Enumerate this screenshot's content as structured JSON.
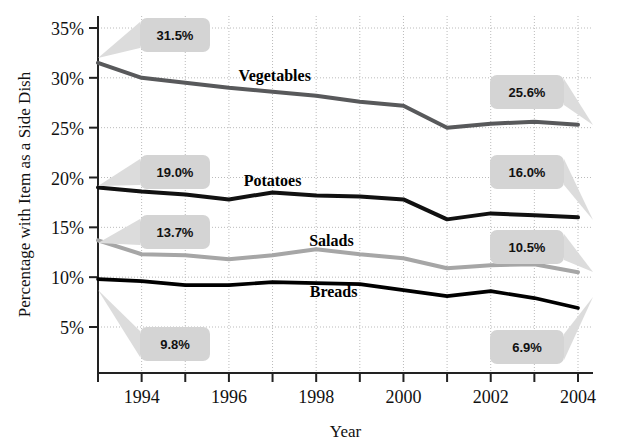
{
  "chart_data": {
    "type": "line",
    "title": "",
    "xlabel": "Year",
    "ylabel": "Percentage with Item as a Side Dish",
    "x": [
      1993,
      1994,
      1995,
      1996,
      1997,
      1998,
      1999,
      2000,
      2001,
      2002,
      2003,
      2004
    ],
    "xtick_labels": [
      "1994",
      "1996",
      "1998",
      "2000",
      "2002",
      "2004"
    ],
    "xtick_values": [
      1994,
      1996,
      1998,
      2000,
      2002,
      2004
    ],
    "ytick_labels": [
      "5%",
      "10%",
      "15%",
      "20%",
      "25%",
      "30%",
      "35%"
    ],
    "ytick_values": [
      5,
      10,
      15,
      20,
      25,
      30,
      35
    ],
    "ylim": [
      2.5,
      35
    ],
    "xlim": [
      1993,
      2004
    ],
    "grid": true,
    "legend_position": "inline-labels",
    "series": [
      {
        "name": "Vegetables",
        "color": "#58595b",
        "width": 4,
        "label_x": 1997.05,
        "label_y": 29.7,
        "values": [
          31.5,
          30.0,
          29.5,
          29.0,
          28.6,
          28.2,
          27.6,
          27.2,
          25.0,
          25.4,
          25.6,
          25.3
        ],
        "start_callout": "31.5%",
        "end_callout": "25.6%"
      },
      {
        "name": "Potatoes",
        "color": "#111111",
        "width": 4,
        "label_x": 1997.0,
        "label_y": 19.1,
        "values": [
          19.0,
          18.6,
          18.3,
          17.8,
          18.5,
          18.2,
          18.1,
          17.8,
          15.8,
          16.4,
          16.2,
          16.0
        ],
        "start_callout": "19.0%",
        "end_callout": "16.0%"
      },
      {
        "name": "Salads",
        "color": "#a6a6a6",
        "width": 4,
        "label_x": 1998.35,
        "label_y": 13.1,
        "values": [
          13.7,
          12.3,
          12.2,
          11.8,
          12.2,
          12.8,
          12.3,
          11.9,
          10.9,
          11.2,
          11.3,
          10.5
        ],
        "start_callout": "13.7%",
        "end_callout": "10.5%"
      },
      {
        "name": "Breads",
        "color": "#000000",
        "width": 3.6,
        "label_x": 1998.4,
        "label_y": 8.0,
        "values": [
          9.8,
          9.6,
          9.2,
          9.2,
          9.5,
          9.4,
          9.3,
          8.7,
          8.1,
          8.6,
          7.9,
          6.9
        ],
        "start_callout": "9.8%",
        "end_callout": "6.9%"
      }
    ],
    "callouts": [
      {
        "text": "31.5%",
        "box_x": 140,
        "box_y": 18,
        "box_w": 70,
        "box_h": 34,
        "anchor_x": 98,
        "anchor_y": 58
      },
      {
        "text": "19.0%",
        "box_x": 140,
        "box_y": 155,
        "box_w": 70,
        "box_h": 34,
        "anchor_x": 98,
        "anchor_y": 186
      },
      {
        "text": "13.7%",
        "box_x": 140,
        "box_y": 215,
        "box_w": 70,
        "box_h": 34,
        "anchor_x": 98,
        "anchor_y": 243
      },
      {
        "text": "9.8%",
        "box_x": 140,
        "box_y": 327,
        "box_w": 70,
        "box_h": 34,
        "anchor_x": 98,
        "anchor_y": 290
      },
      {
        "text": "25.6%",
        "box_x": 490,
        "box_y": 75,
        "box_w": 74,
        "box_h": 34,
        "anchor_x": 593,
        "anchor_y": 125
      },
      {
        "text": "16.0%",
        "box_x": 490,
        "box_y": 155,
        "box_w": 74,
        "box_h": 34,
        "anchor_x": 593,
        "anchor_y": 220
      },
      {
        "text": "10.5%",
        "box_x": 490,
        "box_y": 230,
        "box_w": 74,
        "box_h": 34,
        "anchor_x": 593,
        "anchor_y": 272
      },
      {
        "text": "6.9%",
        "box_x": 490,
        "box_y": 330,
        "box_w": 74,
        "box_h": 34,
        "anchor_x": 593,
        "anchor_y": 297
      }
    ],
    "colors": {
      "vegetables": "#58595b",
      "potatoes": "#111111",
      "salads": "#a6a6a6",
      "breads": "#000000",
      "grid": "#bbbbbb",
      "axis": "#222222",
      "callout_bg": "#d4d4d4"
    }
  }
}
